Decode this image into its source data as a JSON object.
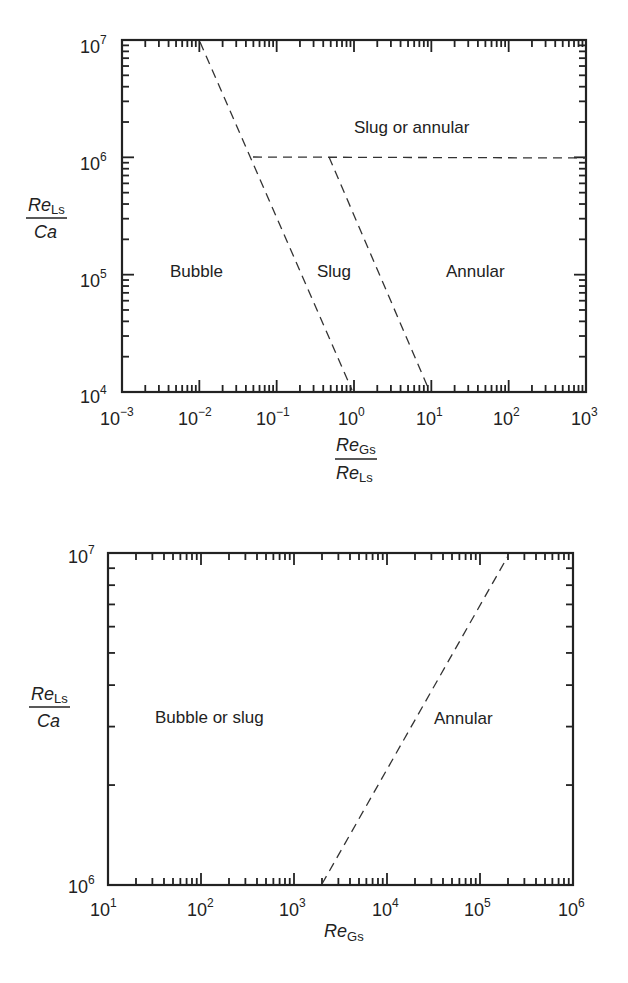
{
  "chart_data": [
    {
      "type": "line",
      "title": "",
      "xlabel": "Re_Gs / Re_Ls",
      "ylabel": "Re_Ls / Ca",
      "xscale": "log",
      "yscale": "log",
      "xlim": [
        0.001,
        1000
      ],
      "ylim": [
        10000,
        10000000
      ],
      "x_ticks": [
        "10^-3",
        "10^-2",
        "10^-1",
        "10^0",
        "10^1",
        "10^2",
        "10^3"
      ],
      "y_ticks": [
        "10^4",
        "10^5",
        "10^6",
        "10^7"
      ],
      "grid": false,
      "series": [
        {
          "name": "bubble-slug boundary",
          "style": "dashed",
          "points": [
            [
              0.012,
              10000000
            ],
            [
              1,
              10000
            ]
          ]
        },
        {
          "name": "slug-annular boundary",
          "style": "dashed",
          "points": [
            [
              0.5,
              1000000
            ],
            [
              10,
              10000
            ]
          ]
        },
        {
          "name": "slug-or-annular boundary",
          "style": "dashed",
          "points": [
            [
              0.05,
              1000000
            ],
            [
              1000,
              1000000
            ]
          ]
        }
      ],
      "annotations": [
        {
          "text": "Slug or annular",
          "x": 2,
          "y": 3000000
        },
        {
          "text": "Bubble",
          "x": 0.01,
          "y": 100000
        },
        {
          "text": "Slug",
          "x": 0.3,
          "y": 100000
        },
        {
          "text": "Annular",
          "x": 20,
          "y": 100000
        }
      ]
    },
    {
      "type": "line",
      "title": "",
      "xlabel": "Re_Gs",
      "ylabel": "Re_Ls / Ca",
      "xscale": "log",
      "yscale": "log",
      "xlim": [
        10,
        1000000
      ],
      "ylim": [
        1000000,
        10000000
      ],
      "x_ticks": [
        "10^1",
        "10^2",
        "10^3",
        "10^4",
        "10^5",
        "10^6"
      ],
      "y_ticks": [
        "10^6",
        "10^7"
      ],
      "grid": false,
      "series": [
        {
          "name": "bubble/slug-annular boundary",
          "style": "dashed",
          "points": [
            [
              2000,
              1000000
            ],
            [
              200000,
              10000000
            ]
          ]
        }
      ],
      "annotations": [
        {
          "text": "Bubble or slug",
          "x": 500,
          "y": 3000000
        },
        {
          "text": "Annular",
          "x": 80000,
          "y": 3000000
        }
      ]
    }
  ],
  "top": {
    "ylabel_num": "Re",
    "ylabel_num_sub": "Ls",
    "ylabel_den": "Ca",
    "xlabel_num": "Re",
    "xlabel_num_sub": "Gs",
    "xlabel_den": "Re",
    "xlabel_den_sub": "Ls",
    "regions": {
      "slug_or_annular": "Slug or annular",
      "bubble": "Bubble",
      "slug": "Slug",
      "annular": "Annular"
    },
    "yticks": [
      {
        "base": "10",
        "exp": "7"
      },
      {
        "base": "10",
        "exp": "6"
      },
      {
        "base": "10",
        "exp": "5"
      },
      {
        "base": "10",
        "exp": "4"
      }
    ],
    "xticks": [
      {
        "base": "10",
        "exp": "−3"
      },
      {
        "base": "10",
        "exp": "−2"
      },
      {
        "base": "10",
        "exp": "−1"
      },
      {
        "base": "10",
        "exp": "0"
      },
      {
        "base": "10",
        "exp": "1"
      },
      {
        "base": "10",
        "exp": "2"
      },
      {
        "base": "10",
        "exp": "3"
      }
    ]
  },
  "bottom": {
    "ylabel_num": "Re",
    "ylabel_num_sub": "Ls",
    "ylabel_den": "Ca",
    "xlabel": "Re",
    "xlabel_sub": "Gs",
    "regions": {
      "bubble_or_slug": "Bubble or slug",
      "annular": "Annular"
    },
    "yticks": [
      {
        "base": "10",
        "exp": "7"
      },
      {
        "base": "10",
        "exp": "6"
      }
    ],
    "xticks": [
      {
        "base": "10",
        "exp": "1"
      },
      {
        "base": "10",
        "exp": "2"
      },
      {
        "base": "10",
        "exp": "3"
      },
      {
        "base": "10",
        "exp": "4"
      },
      {
        "base": "10",
        "exp": "5"
      },
      {
        "base": "10",
        "exp": "6"
      }
    ]
  }
}
